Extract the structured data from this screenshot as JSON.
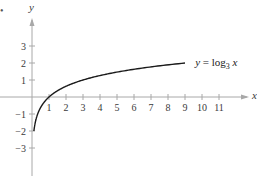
{
  "figure": {
    "marker": "•"
  },
  "colors": {
    "axis": "#a8a8a8",
    "curve": "#1a1a1a",
    "text": "#3a3a3a"
  },
  "chart_data": {
    "type": "line",
    "title": "",
    "xlabel": "x",
    "ylabel": "y",
    "xlim": [
      -1.9,
      12.9
    ],
    "ylim": [
      -4.6,
      5.2
    ],
    "grid": false,
    "x_ticks": [
      1,
      2,
      3,
      4,
      5,
      6,
      7,
      8,
      9,
      10,
      11
    ],
    "y_ticks": [
      -3,
      -2,
      -1,
      1,
      2,
      3
    ],
    "series": [
      {
        "name": "y = log3 x",
        "function": "log3(x)",
        "x": [
          0.111,
          0.2,
          0.333,
          0.5,
          1,
          2,
          3,
          4,
          5,
          6,
          7,
          8,
          9
        ],
        "values": [
          -2,
          -1.465,
          -1,
          -0.631,
          0,
          0.631,
          1,
          1.262,
          1.465,
          1.631,
          1.771,
          1.893,
          2
        ]
      }
    ],
    "annotations": [
      {
        "text": "y = log",
        "subscript": "3",
        "suffix": " x",
        "x": 9.6,
        "y": 2.05
      }
    ]
  }
}
